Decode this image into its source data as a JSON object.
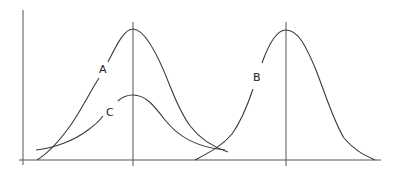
{
  "diagram": {
    "type": "distribution-curves",
    "curves": [
      {
        "id": "A",
        "label": "A",
        "peak_x": 133,
        "peak_y": 29,
        "description": "tall bell curve centered on left vertical line"
      },
      {
        "id": "C",
        "label": "C",
        "peak_x": 133,
        "peak_y": 95,
        "description": "shorter, wider bell curve sharing center with A"
      },
      {
        "id": "B",
        "label": "B",
        "peak_x": 286,
        "peak_y": 30,
        "description": "tall bell curve centered on right vertical line"
      }
    ],
    "labels": {
      "a": "A",
      "b": "B",
      "c": "C"
    },
    "colors": {
      "line": "#3a3a3a",
      "axis": "#555555",
      "background": "#ffffff"
    }
  }
}
